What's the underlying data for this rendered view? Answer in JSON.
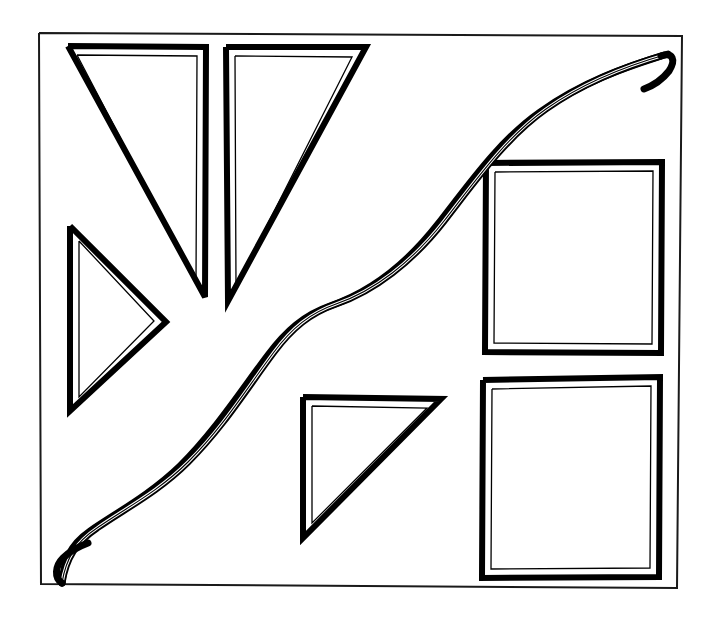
{
  "image": {
    "title": "Hand-drawn geometric shapes diagram",
    "description": "A thin rectangular border frame containing four hand-drawn double-outlined triangles, two hand-drawn double-outlined rectangles, and a thick S-shaped ribbon curve running from the lower-left corner to the upper-right corner.",
    "width": 715,
    "height": 619,
    "background_color": "#ffffff",
    "ink_color": "#000000"
  },
  "frame": {
    "name": "outer-border",
    "stroke_color": "#1a1a1a",
    "stroke_width": 2,
    "x": 39,
    "y": 32,
    "width": 643,
    "height": 556,
    "points": "39,33 682,36 677,588 41,584 39,33"
  },
  "style": {
    "outer_stroke_width": 6,
    "inner_stroke_width": 1.3,
    "ribbon_outer_width": 7,
    "ribbon_inner_width": 1.2
  },
  "shapes": [
    {
      "id": "triangle-top-left",
      "type": "triangle",
      "label": "Top-left right triangle pointing down-left",
      "outer_points": "68,46 206,47 205,297 68,46",
      "inner_points": "77,55 197,56 196,283 77,55"
    },
    {
      "id": "triangle-top-right",
      "type": "triangle",
      "label": "Top-centre right triangle pointing down",
      "outer_points": "226,47 366,47 228,301 226,47",
      "inner_points": "235,56 352,57 236,287 235,56"
    },
    {
      "id": "triangle-left-pointing-right",
      "type": "triangle",
      "label": "Left-side triangle pointing right",
      "outer_points": "70,226 166,322 70,411 70,226",
      "inner_points": "79,241 154,321 79,397 79,241"
    },
    {
      "id": "triangle-bottom-centre",
      "type": "triangle",
      "label": "Bottom-centre right triangle pointing down-left",
      "outer_points": "303,397 441,399 303,538 303,397",
      "inner_points": "312,406 427,408 312,523 312,406"
    },
    {
      "id": "rectangle-upper-right",
      "type": "rectangle",
      "label": "Upper-right rectangle",
      "outer_points": "486,163 662,162 661,353 485,352 486,163",
      "inner_points": "495,172 653,171 652,344 494,343 495,172"
    },
    {
      "id": "rectangle-lower-right",
      "type": "rectangle",
      "label": "Lower-right rectangle",
      "outer_points": "483,380 660,377 659,577 482,578 483,380",
      "inner_points": "492,389 651,386 650,568 491,569 492,389"
    }
  ],
  "ribbon": {
    "id": "s-curve-ribbon",
    "label": "Thick S-shaped ribbon curve from bottom-left corner to top-right corner",
    "outer_path": "M 62,583 C 64,560 70,545 90,531 C 116,513 150,495 180,466 C 216,430 240,392 268,355 C 286,331 304,315 330,306 C 368,293 406,265 438,224 C 470,183 500,140 540,112 C 585,80 630,66 661,56",
    "inner_path": "M 62,583 C 66,558 76,542 97,528 C 124,509 158,492 188,462 C 224,426 247,388 274,352 C 292,328 310,313 336,304 C 374,291 412,262 444,221 C 476,180 506,137 546,109 C 590,78 636,63 668,54",
    "hook_top_path": "M 661,56 C 673,52 676,60 669,71 C 662,80 652,86 644,89",
    "hook_bottom_path": "M 62,583 C 54,578 55,566 63,558 C 70,551 80,546 88,543"
  },
  "counts": {
    "triangles": 4,
    "rectangles": 2,
    "curves": 1,
    "frames": 1
  }
}
